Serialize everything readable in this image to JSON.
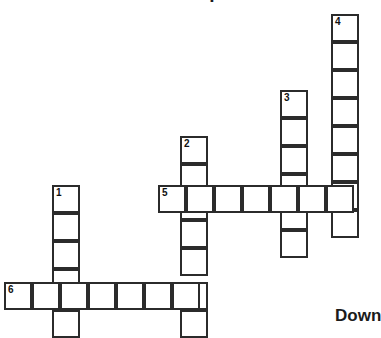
{
  "page": {
    "title": "Crossword puzzle",
    "background_color": "#ffffff"
  },
  "puzzle": {
    "cell_size_px": 28,
    "grid_line_color": "#2b2b2b",
    "cell_fill_color": "#ffffff",
    "number_color": "#101010",
    "headings": {
      "down_label": "Down"
    },
    "entries": [
      {
        "number": "1",
        "direction": "down",
        "length": 6,
        "start_col": 2,
        "start_row": 7
      },
      {
        "number": "2",
        "direction": "down",
        "length": 7,
        "start_col": 7,
        "start_row": 5
      },
      {
        "number": "3",
        "direction": "down",
        "length": 7,
        "start_col": 10,
        "start_row": 3
      },
      {
        "number": "4",
        "direction": "down",
        "length": 9,
        "start_col": 12,
        "start_row": 0
      },
      {
        "number": "5",
        "direction": "across",
        "length": 7,
        "start_col": 6,
        "start_row": 7
      },
      {
        "number": "6",
        "direction": "across",
        "length": 7,
        "start_col": 0,
        "start_row": 10
      }
    ],
    "cells": [
      {
        "name": "cell-c12-r0",
        "x": 331,
        "y": 14,
        "number": "4",
        "letter": ""
      },
      {
        "name": "cell-c12-r1",
        "x": 331,
        "y": 42,
        "number": "",
        "letter": ""
      },
      {
        "name": "cell-c12-r2",
        "x": 331,
        "y": 70,
        "number": "",
        "letter": ""
      },
      {
        "name": "cell-c12-r3",
        "x": 331,
        "y": 98,
        "number": "",
        "letter": ""
      },
      {
        "name": "cell-c12-r4",
        "x": 331,
        "y": 126,
        "number": "",
        "letter": ""
      },
      {
        "name": "cell-c12-r5",
        "x": 331,
        "y": 154,
        "number": "",
        "letter": ""
      },
      {
        "name": "cell-c12-r6",
        "x": 331,
        "y": 182,
        "number": "",
        "letter": ""
      },
      {
        "name": "cell-c12-r7",
        "x": 331,
        "y": 210,
        "number": "",
        "letter": ""
      },
      {
        "name": "cell-c10-r3",
        "x": 280,
        "y": 90,
        "number": "3",
        "letter": ""
      },
      {
        "name": "cell-c10-r4",
        "x": 280,
        "y": 118,
        "number": "",
        "letter": ""
      },
      {
        "name": "cell-c10-r5",
        "x": 280,
        "y": 146,
        "number": "",
        "letter": ""
      },
      {
        "name": "cell-c10-r6",
        "x": 280,
        "y": 174,
        "number": "",
        "letter": ""
      },
      {
        "name": "cell-c10-r7",
        "x": 280,
        "y": 202,
        "number": "",
        "letter": ""
      },
      {
        "name": "cell-c10-r8",
        "x": 280,
        "y": 230,
        "number": "",
        "letter": ""
      },
      {
        "name": "cell-c7-r5",
        "x": 180,
        "y": 136,
        "number": "2",
        "letter": ""
      },
      {
        "name": "cell-c7-r6",
        "x": 180,
        "y": 164,
        "number": "",
        "letter": ""
      },
      {
        "name": "cell-c7-r7",
        "x": 180,
        "y": 192,
        "number": "",
        "letter": ""
      },
      {
        "name": "cell-c7-r8",
        "x": 180,
        "y": 220,
        "number": "",
        "letter": ""
      },
      {
        "name": "cell-c7-r9",
        "x": 180,
        "y": 248,
        "number": "",
        "letter": ""
      },
      {
        "name": "cell-c7-r10",
        "x": 180,
        "y": 282,
        "number": "",
        "letter": ""
      },
      {
        "name": "cell-c7-r11",
        "x": 180,
        "y": 310,
        "number": "",
        "letter": ""
      },
      {
        "name": "cell-c2-r7",
        "x": 52,
        "y": 185,
        "number": "1",
        "letter": ""
      },
      {
        "name": "cell-c2-r8",
        "x": 52,
        "y": 213,
        "number": "",
        "letter": ""
      },
      {
        "name": "cell-c2-r9",
        "x": 52,
        "y": 241,
        "number": "",
        "letter": ""
      },
      {
        "name": "cell-c2-r10",
        "x": 52,
        "y": 269,
        "number": "",
        "letter": ""
      },
      {
        "name": "cell-c2-r11",
        "x": 52,
        "y": 310,
        "number": "",
        "letter": ""
      },
      {
        "name": "cell-across5-0",
        "x": 158,
        "y": 185,
        "number": "5",
        "letter": ""
      },
      {
        "name": "cell-across5-1",
        "x": 186,
        "y": 185,
        "number": "",
        "letter": ""
      },
      {
        "name": "cell-across5-2",
        "x": 214,
        "y": 185,
        "number": "",
        "letter": ""
      },
      {
        "name": "cell-across5-3",
        "x": 242,
        "y": 185,
        "number": "",
        "letter": ""
      },
      {
        "name": "cell-across5-4",
        "x": 270,
        "y": 185,
        "number": "",
        "letter": ""
      },
      {
        "name": "cell-across5-5",
        "x": 298,
        "y": 185,
        "number": "",
        "letter": ""
      },
      {
        "name": "cell-across5-6",
        "x": 326,
        "y": 185,
        "number": "",
        "letter": ""
      },
      {
        "name": "cell-across6-0",
        "x": 4,
        "y": 282,
        "number": "6",
        "letter": ""
      },
      {
        "name": "cell-across6-1",
        "x": 32,
        "y": 282,
        "number": "",
        "letter": ""
      },
      {
        "name": "cell-across6-2",
        "x": 60,
        "y": 282,
        "number": "",
        "letter": ""
      },
      {
        "name": "cell-across6-3",
        "x": 88,
        "y": 282,
        "number": "",
        "letter": ""
      },
      {
        "name": "cell-across6-4",
        "x": 116,
        "y": 282,
        "number": "",
        "letter": ""
      },
      {
        "name": "cell-across6-5",
        "x": 144,
        "y": 282,
        "number": "",
        "letter": ""
      },
      {
        "name": "cell-across6-6",
        "x": 172,
        "y": 282,
        "number": "",
        "letter": ""
      }
    ]
  }
}
